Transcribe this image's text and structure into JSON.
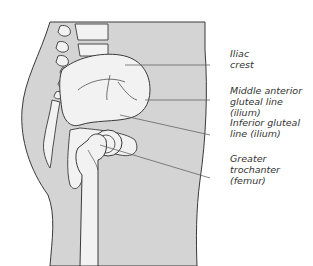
{
  "diagram": {
    "labels": [
      {
        "id": "iliac-crest",
        "lines": [
          "Iliac",
          "crest"
        ]
      },
      {
        "id": "middle-anterior-gluteal-line",
        "lines": [
          "Middle anterior",
          "gluteal line (ilium)"
        ]
      },
      {
        "id": "inferior-gluteal-line",
        "lines": [
          "Inferior gluteal",
          "line (ilium)"
        ]
      },
      {
        "id": "greater-trochanter",
        "lines": [
          "Greater",
          "trochanter",
          "(femur)"
        ]
      }
    ],
    "colors": {
      "body_fill": "#d4d4d4",
      "bone_fill": "#f2f2f2",
      "outline": "#3a3a3a",
      "leader": "#555555",
      "text": "#333333"
    }
  }
}
